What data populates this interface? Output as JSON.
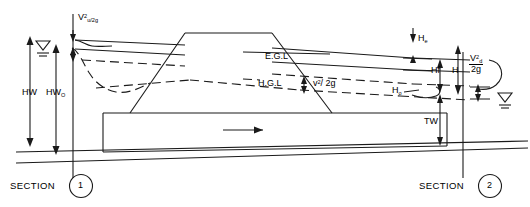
{
  "diagram": {
    "stroke_color": "#1a1a1a",
    "background": "#ffffff"
  },
  "labels": {
    "velocity_head_upstream": {
      "base": "V",
      "sup": "2",
      "sub": "u/2g",
      "text": "V2u/2g"
    },
    "headwater": "HW",
    "headwater_outlet": {
      "base": "HW",
      "sub": "O",
      "text": "HWO"
    },
    "energy_grade_line": "E.G.L",
    "hydraulic_grade_line": "H.G.L",
    "velocity_head_barrel": {
      "base": "v",
      "sup": "2",
      "rest": "/ 2g",
      "text": "v2/ 2g"
    },
    "entrance_loss": {
      "base": "H",
      "sub": "e",
      "text": "He"
    },
    "friction_loss": "Hf",
    "total_head": "H",
    "outlet_head": {
      "base": "H",
      "sub": "o",
      "text": "Ho"
    },
    "velocity_head_downstream": {
      "numerator_base": "V",
      "numerator_sup": "2",
      "numerator_sub": "d",
      "denominator": "2g",
      "text": "V2d/2g"
    },
    "tailwater": "TW"
  },
  "sections": [
    {
      "label": "SECTION",
      "number": "1",
      "name": "section-1"
    },
    {
      "label": "SECTION",
      "number": "2",
      "name": "section-2"
    }
  ],
  "flow": {
    "direction_arrow": "flow-direction-arrow"
  },
  "water_surface_symbols": [
    {
      "name": "water-surface-symbol-upstream"
    },
    {
      "name": "water-surface-symbol-downstream"
    }
  ]
}
